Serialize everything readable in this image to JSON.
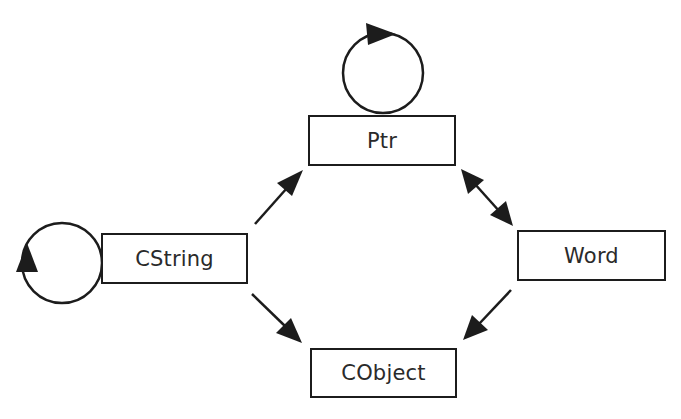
{
  "diagram": {
    "type": "class-dependency-graph",
    "nodes": [
      {
        "id": "ptr",
        "label": "Ptr",
        "x": 308,
        "y": 115,
        "w": 148,
        "h": 51,
        "self_loop": true
      },
      {
        "id": "cstring",
        "label": "CString",
        "x": 101,
        "y": 233,
        "w": 147,
        "h": 51,
        "self_loop": true
      },
      {
        "id": "word",
        "label": "Word",
        "x": 517,
        "y": 230,
        "w": 149,
        "h": 51,
        "self_loop": false
      },
      {
        "id": "cobject",
        "label": "CObject",
        "x": 310,
        "y": 348,
        "w": 147,
        "h": 50,
        "self_loop": false
      }
    ],
    "edges": [
      {
        "from": "ptr",
        "to": "ptr",
        "kind": "self-loop"
      },
      {
        "from": "cstring",
        "to": "cstring",
        "kind": "self-loop"
      },
      {
        "from": "cstring",
        "to": "ptr",
        "kind": "directed"
      },
      {
        "from": "ptr",
        "to": "word",
        "kind": "bidirectional"
      },
      {
        "from": "cstring",
        "to": "cobject",
        "kind": "directed"
      },
      {
        "from": "word",
        "to": "cobject",
        "kind": "directed"
      }
    ],
    "colors": {
      "stroke": "#1c1c1c",
      "text": "#2a2a2a",
      "background": "#ffffff"
    }
  }
}
